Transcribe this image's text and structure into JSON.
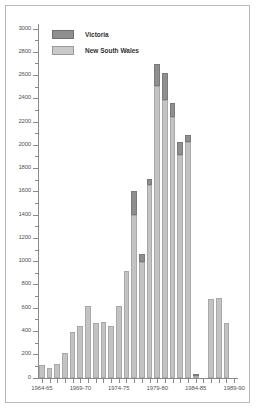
{
  "chart_data": {
    "type": "bar",
    "subtype": "stacked-vertical",
    "title": "",
    "subtitle": "",
    "xlabel": "",
    "ylabel": "",
    "ylim": [
      0,
      3000
    ],
    "ytick_step": 200,
    "yticks": [
      0,
      200,
      400,
      600,
      800,
      1000,
      1200,
      1400,
      1600,
      1800,
      2000,
      2200,
      2400,
      2600,
      2800,
      3000
    ],
    "ytick_labels": [
      "0",
      "200",
      "400",
      "600",
      "800",
      "1000",
      "1200",
      "1400",
      "1600",
      "1800",
      "2000",
      "2200",
      "2400",
      "2600",
      "2800",
      "3000"
    ],
    "grid": false,
    "legend_position": "top-left",
    "categories": [
      "1964-65",
      "1965-66",
      "1966-67",
      "1967-68",
      "1968-69",
      "1969-70",
      "1970-71",
      "1971-72",
      "1972-73",
      "1973-74",
      "1974-75",
      "1975-76",
      "1976-77",
      "1977-78",
      "1978-79",
      "1979-80",
      "1980-81",
      "1981-82",
      "1982-83",
      "1983-84",
      "1984-85",
      "1985-86",
      "1986-87",
      "1987-88",
      "1988-89",
      "1989-90"
    ],
    "xtick_labels": [
      "1964-65",
      "1969-70",
      "1974-75",
      "1979-80",
      "1984-85",
      "1989-90"
    ],
    "xtick_label_indices": [
      0,
      5,
      10,
      15,
      20,
      25
    ],
    "series": [
      {
        "name": "New South Wales",
        "color": "#c3c3c3",
        "values": [
          110,
          85,
          120,
          215,
          395,
          450,
          620,
          470,
          480,
          445,
          620,
          920,
          1400,
          1000,
          1660,
          2510,
          2390,
          2245,
          1920,
          2030,
          20,
          0,
          675,
          690,
          470,
          0
        ]
      },
      {
        "name": "Victoria",
        "color": "#8f8f8f",
        "values": [
          0,
          0,
          0,
          0,
          0,
          0,
          0,
          0,
          0,
          0,
          0,
          0,
          210,
          65,
          55,
          190,
          230,
          115,
          110,
          60,
          5,
          0,
          0,
          0,
          0,
          0
        ]
      }
    ],
    "totals": [
      110,
      85,
      120,
      215,
      395,
      450,
      620,
      470,
      480,
      445,
      620,
      920,
      1610,
      1065,
      1715,
      2700,
      2620,
      2360,
      2030,
      2090,
      25,
      0,
      675,
      690,
      470,
      0
    ]
  },
  "legend": {
    "entries": [
      {
        "label": "Victoria",
        "swatch": "vic"
      },
      {
        "label": "New South Wales",
        "swatch": "nsw"
      }
    ]
  },
  "colors": {
    "victoria": "#8f8f8f",
    "new_south_wales": "#c3c3c3",
    "axis": "#8a8a8a",
    "frame": "#b9b9b9",
    "text": "#555555",
    "background": "#ffffff"
  }
}
